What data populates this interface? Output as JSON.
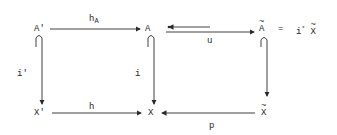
{
  "diagram": {
    "type": "commutative-diagram",
    "nodes": {
      "A_prime": "A'",
      "A": "A",
      "A_tilde": "A",
      "eq": "=",
      "i_star": "i",
      "star": "*",
      "X_tilde_top": "X",
      "X_prime": "X'",
      "X": "X",
      "X_tilde": "X"
    },
    "arrows": {
      "h_A": {
        "label": "h",
        "sub": "A"
      },
      "u": {
        "label": "u"
      },
      "i_prime": {
        "label": "i'"
      },
      "i": {
        "label": "i"
      },
      "h": {
        "label": "h"
      },
      "p": {
        "label": "p"
      }
    },
    "colors": {
      "ink": "#2a2a2a",
      "background": "#ffffff"
    }
  }
}
